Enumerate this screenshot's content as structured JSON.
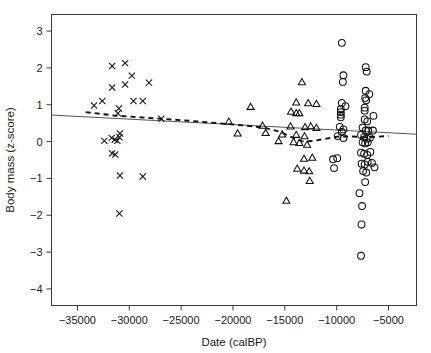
{
  "chart_data": {
    "type": "scatter",
    "title": "",
    "xlabel": "Date (calBP)",
    "ylabel": "Body mass (z-score)",
    "xlim": [
      -37500,
      -2300
    ],
    "ylim": [
      -4.45,
      3.45
    ],
    "xticks": [
      -35000,
      -30000,
      -25000,
      -20000,
      -15000,
      -10000,
      -5000
    ],
    "xticklabels": [
      "−35000",
      "−30000",
      "−25000",
      "−20000",
      "−15000",
      "−10000",
      "−5000"
    ],
    "yticks": [
      3,
      2,
      1,
      0,
      -1,
      -2,
      -3,
      -4
    ],
    "yticklabels": [
      "3",
      "2",
      "1",
      "0",
      "−1",
      "−2",
      "−3",
      "−4"
    ],
    "grid": false,
    "legend": "none",
    "series": [
      {
        "name": "early-period",
        "marker": "cross",
        "points": [
          [
            -31650,
            2.05
          ],
          [
            -30400,
            2.13
          ],
          [
            -31650,
            1.47
          ],
          [
            -30400,
            1.55
          ],
          [
            -29750,
            1.79
          ],
          [
            -28100,
            1.6
          ],
          [
            -33400,
            0.98
          ],
          [
            -32600,
            1.1
          ],
          [
            -31000,
            0.9
          ],
          [
            -29600,
            1.1
          ],
          [
            -28700,
            1.1
          ],
          [
            -31100,
            0.77
          ],
          [
            -26900,
            0.62
          ],
          [
            -30900,
            0.22
          ],
          [
            -30950,
            0.12
          ],
          [
            -32400,
            0.02
          ],
          [
            -31700,
            0.1
          ],
          [
            -31400,
            0.05
          ],
          [
            -31150,
            0.02
          ],
          [
            -31650,
            -0.32
          ],
          [
            -31350,
            -0.35
          ],
          [
            -30900,
            -0.92
          ],
          [
            -28700,
            -0.95
          ],
          [
            -30950,
            -1.95
          ]
        ]
      },
      {
        "name": "mid-period",
        "marker": "triangle",
        "points": [
          [
            -13350,
            1.6
          ],
          [
            -18300,
            0.93
          ],
          [
            -13900,
            1.05
          ],
          [
            -12750,
            1.03
          ],
          [
            -11950,
            1.01
          ],
          [
            -14400,
            0.8
          ],
          [
            -13900,
            0.76
          ],
          [
            -13600,
            0.76
          ],
          [
            -20400,
            0.53
          ],
          [
            -17150,
            0.42
          ],
          [
            -14450,
            0.4
          ],
          [
            -13050,
            0.38
          ],
          [
            -12500,
            0.4
          ],
          [
            -11950,
            0.36
          ],
          [
            -19550,
            0.21
          ],
          [
            -16850,
            0.22
          ],
          [
            -15250,
            0.18
          ],
          [
            -13900,
            0.17
          ],
          [
            -13100,
            0.13
          ],
          [
            -15600,
            0.0
          ],
          [
            -14150,
            -0.03
          ],
          [
            -13600,
            -0.05
          ],
          [
            -12850,
            -0.1
          ],
          [
            -13150,
            -0.48
          ],
          [
            -12350,
            -0.45
          ],
          [
            -13150,
            -0.8
          ],
          [
            -12650,
            -0.82
          ],
          [
            -13800,
            -0.75
          ],
          [
            -12600,
            -1.08
          ],
          [
            -14850,
            -1.62
          ]
        ]
      },
      {
        "name": "late-period",
        "marker": "circle",
        "points": [
          [
            -9500,
            2.68
          ],
          [
            -7200,
            2.02
          ],
          [
            -7100,
            1.9
          ],
          [
            -9350,
            1.8
          ],
          [
            -9400,
            1.62
          ],
          [
            -7200,
            1.38
          ],
          [
            -6850,
            1.29
          ],
          [
            -7250,
            1.18
          ],
          [
            -7150,
            1.12
          ],
          [
            -9500,
            1.05
          ],
          [
            -9150,
            0.96
          ],
          [
            -9600,
            0.88
          ],
          [
            -9600,
            0.8
          ],
          [
            -9600,
            0.73
          ],
          [
            -9600,
            0.66
          ],
          [
            -7300,
            0.92
          ],
          [
            -7300,
            0.84
          ],
          [
            -6450,
            0.7
          ],
          [
            -7300,
            0.6
          ],
          [
            -7050,
            0.55
          ],
          [
            -9700,
            0.4
          ],
          [
            -9350,
            0.33
          ],
          [
            -9500,
            0.26
          ],
          [
            -7500,
            0.38
          ],
          [
            -7200,
            0.3
          ],
          [
            -6950,
            0.3
          ],
          [
            -6500,
            0.3
          ],
          [
            -9900,
            0.15
          ],
          [
            -9350,
            0.1
          ],
          [
            -7650,
            0.18
          ],
          [
            -7350,
            0.12
          ],
          [
            -7100,
            0.08
          ],
          [
            -6800,
            0.1
          ],
          [
            -7500,
            -0.02
          ],
          [
            -7250,
            -0.05
          ],
          [
            -7000,
            -0.02
          ],
          [
            -10350,
            -0.48
          ],
          [
            -9950,
            -0.45
          ],
          [
            -7650,
            -0.3
          ],
          [
            -7350,
            -0.33
          ],
          [
            -7050,
            -0.36
          ],
          [
            -6750,
            -0.28
          ],
          [
            -7600,
            -0.6
          ],
          [
            -7300,
            -0.62
          ],
          [
            -7000,
            -0.55
          ],
          [
            -6600,
            -0.58
          ],
          [
            -10250,
            -0.72
          ],
          [
            -7450,
            -0.8
          ],
          [
            -7150,
            -0.84
          ],
          [
            -6350,
            -0.7
          ],
          [
            -7250,
            -1.1
          ],
          [
            -7800,
            -1.4
          ],
          [
            -7550,
            -1.75
          ],
          [
            -7600,
            -2.25
          ],
          [
            -7650,
            -3.1
          ]
        ]
      }
    ],
    "fits": [
      {
        "name": "linear-regression",
        "style": "solid",
        "x": [
          -37500,
          -2300
        ],
        "y": [
          0.72,
          0.2
        ]
      },
      {
        "name": "loess-smoother",
        "style": "dashed",
        "points": [
          [
            -34200,
            0.8
          ],
          [
            -31500,
            0.71
          ],
          [
            -29000,
            0.66
          ],
          [
            -26500,
            0.61
          ],
          [
            -24000,
            0.56
          ],
          [
            -21500,
            0.5
          ],
          [
            -19000,
            0.44
          ],
          [
            -17000,
            0.38
          ],
          [
            -15500,
            0.27
          ],
          [
            -14200,
            0.1
          ],
          [
            -13200,
            0.0
          ],
          [
            -12200,
            0.02
          ],
          [
            -11000,
            0.08
          ],
          [
            -9800,
            0.14
          ],
          [
            -8600,
            0.14
          ],
          [
            -7400,
            0.12
          ],
          [
            -6200,
            0.13
          ],
          [
            -5000,
            0.15
          ]
        ]
      }
    ]
  },
  "axis_title_x": "Date (calBP)",
  "axis_title_y": "Body mass (z-score)"
}
